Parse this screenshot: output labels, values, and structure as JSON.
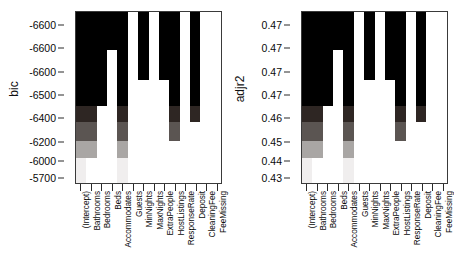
{
  "chart_data": [
    {
      "type": "heatmap",
      "panel_id": "bic",
      "title": "",
      "ylabel": "bic",
      "xlabel": "",
      "grid": false,
      "legend": "none",
      "ytick_labels": [
        "-6600",
        "-6600",
        "-6600",
        "-6500",
        "-6400",
        "-6200",
        "-6000",
        "-5700"
      ],
      "ytick_positions_pct": [
        8.0,
        21.5,
        35.0,
        48.5,
        62.0,
        75.5,
        86.5,
        96.5
      ],
      "categories": [
        "(Intercept)",
        "Bathrooms",
        "Bedrooms",
        "Beds",
        "Accommodates",
        "Guests",
        "MinNights",
        "MaxNights",
        "ExtraPeople",
        "HostListings",
        "ResponseRate",
        "Deposit",
        "CleaningFee",
        "FeeMissing"
      ],
      "row_heights_pct": [
        14.5,
        8.0,
        9.0,
        8.5,
        15.0,
        9.5,
        11.0,
        10.0,
        14.5
      ],
      "row_shades": [
        "#000000",
        "#000000",
        "#000000",
        "#000000",
        "#000000",
        "#2e2623",
        "#5b5552",
        "#a9a6a4",
        "#f0eeee"
      ],
      "rows": [
        [
          1,
          1,
          1,
          1,
          1,
          0,
          1,
          0,
          1,
          1,
          0,
          1,
          0,
          0
        ],
        [
          1,
          1,
          1,
          1,
          1,
          0,
          1,
          0,
          1,
          1,
          0,
          1,
          0,
          0
        ],
        [
          1,
          1,
          1,
          0,
          1,
          0,
          1,
          0,
          1,
          1,
          0,
          1,
          0,
          0
        ],
        [
          1,
          1,
          1,
          0,
          1,
          0,
          1,
          0,
          1,
          1,
          0,
          1,
          0,
          0
        ],
        [
          1,
          1,
          1,
          0,
          1,
          0,
          0,
          0,
          0,
          1,
          0,
          1,
          0,
          0
        ],
        [
          1,
          1,
          0,
          0,
          1,
          0,
          0,
          0,
          0,
          1,
          0,
          1,
          0,
          0
        ],
        [
          1,
          1,
          0,
          0,
          1,
          0,
          0,
          0,
          0,
          1,
          0,
          0,
          0,
          0
        ],
        [
          1,
          1,
          0,
          0,
          1,
          0,
          0,
          0,
          0,
          0,
          0,
          0,
          0,
          0
        ],
        [
          1,
          0,
          0,
          0,
          1,
          0,
          0,
          0,
          0,
          0,
          0,
          0,
          0,
          0
        ]
      ]
    },
    {
      "type": "heatmap",
      "panel_id": "adjr2",
      "title": "",
      "ylabel": "adjr2",
      "xlabel": "",
      "grid": false,
      "legend": "none",
      "ytick_labels": [
        "0.47",
        "0.47",
        "0.47",
        "0.47",
        "0.46",
        "0.45",
        "0.44",
        "0.43"
      ],
      "ytick_positions_pct": [
        8.0,
        21.5,
        35.0,
        48.5,
        62.0,
        75.5,
        86.5,
        96.5
      ],
      "categories": [
        "(Intercept)",
        "Bathrooms",
        "Bedrooms",
        "Beds",
        "Accommodates",
        "Guests",
        "MinNights",
        "MaxNights",
        "ExtraPeople",
        "HostListings",
        "ResponseRate",
        "Deposit",
        "CleaningFee",
        "FeeMissing"
      ],
      "row_heights_pct": [
        14.5,
        8.0,
        9.0,
        8.5,
        15.0,
        9.5,
        11.0,
        10.0,
        14.5
      ],
      "row_shades": [
        "#000000",
        "#000000",
        "#000000",
        "#000000",
        "#000000",
        "#2e2623",
        "#5b5552",
        "#a9a6a4",
        "#f0eeee"
      ],
      "rows": [
        [
          1,
          1,
          1,
          1,
          1,
          0,
          1,
          0,
          1,
          1,
          0,
          1,
          0,
          0
        ],
        [
          1,
          1,
          1,
          1,
          1,
          0,
          1,
          0,
          1,
          1,
          0,
          1,
          0,
          0
        ],
        [
          1,
          1,
          1,
          0,
          1,
          0,
          1,
          0,
          1,
          1,
          0,
          1,
          0,
          0
        ],
        [
          1,
          1,
          1,
          0,
          1,
          0,
          1,
          0,
          1,
          1,
          0,
          1,
          0,
          0
        ],
        [
          1,
          1,
          1,
          0,
          1,
          0,
          0,
          0,
          0,
          1,
          0,
          1,
          0,
          0
        ],
        [
          1,
          1,
          0,
          0,
          1,
          0,
          0,
          0,
          0,
          1,
          0,
          1,
          0,
          0
        ],
        [
          1,
          1,
          0,
          0,
          1,
          0,
          0,
          0,
          0,
          1,
          0,
          0,
          0,
          0
        ],
        [
          1,
          1,
          0,
          0,
          1,
          0,
          0,
          0,
          0,
          0,
          0,
          0,
          0,
          0
        ],
        [
          1,
          0,
          0,
          0,
          1,
          0,
          0,
          0,
          0,
          0,
          0,
          0,
          0,
          0
        ]
      ]
    }
  ],
  "panels": {
    "left": {
      "ylabel": "bic"
    },
    "right": {
      "ylabel": "adjr2"
    }
  },
  "colors": {
    "axis": "#3a3a3a",
    "text": "#0a0a0a",
    "background": "#ffffff",
    "cell_filled": "#000000",
    "cell_empty": "#ffffff"
  }
}
